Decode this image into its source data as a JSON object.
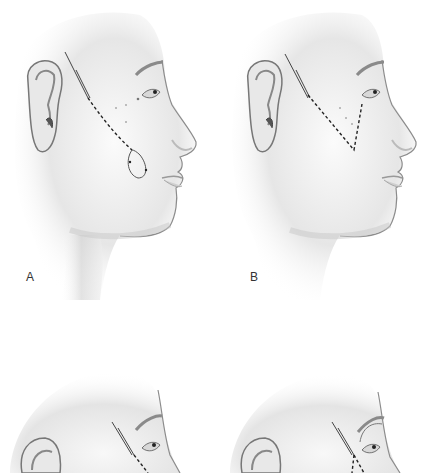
{
  "figure": {
    "panels": [
      {
        "id": "A",
        "label": "A",
        "incision": "loop",
        "description": "Temporal incision with dashed path descending to a looped suture near the nasolabial fold"
      },
      {
        "id": "B",
        "label": "B",
        "incision": "v-shape",
        "description": "Temporal incision with dashed V-shaped path toward the lower eyelid"
      },
      {
        "id": "C",
        "label": "",
        "incision": "lateral-canthal",
        "description": "Temporal incision with dashed path near lateral canthus (cropped)"
      },
      {
        "id": "D",
        "label": "",
        "incision": "brow-loop",
        "description": "Temporal incision with dashed paths and curved arrow toward brow (cropped)"
      }
    ],
    "colors": {
      "background": "#ffffff",
      "skin_light": "#f4f4f4",
      "skin_shadow": "#9a9a9a",
      "line": "#333333"
    }
  }
}
